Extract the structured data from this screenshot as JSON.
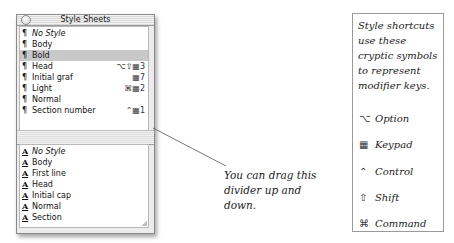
{
  "window": {
    "title": "Style Sheets",
    "paragraph_styles": [
      {
        "label": "No Style",
        "italic": true,
        "shortcut": ""
      },
      {
        "label": "Body",
        "italic": false,
        "shortcut": ""
      },
      {
        "label": "Bold",
        "italic": false,
        "shortcut": "",
        "selected": true
      },
      {
        "label": "Head",
        "italic": false,
        "shortcut": "⌥⇧▦3"
      },
      {
        "label": "Initial graf",
        "italic": false,
        "shortcut": "▦7"
      },
      {
        "label": "Light",
        "italic": false,
        "shortcut": "⌘▦2"
      },
      {
        "label": "Normal",
        "italic": false,
        "shortcut": ""
      },
      {
        "label": "Section number",
        "italic": false,
        "shortcut": "⌃▦1"
      }
    ],
    "character_styles": [
      {
        "label": "No Style",
        "italic": true
      },
      {
        "label": "Body",
        "italic": false
      },
      {
        "label": "First line",
        "italic": false
      },
      {
        "label": "Head",
        "italic": false
      },
      {
        "label": "Initial cap",
        "italic": false
      },
      {
        "label": "Normal",
        "italic": false
      },
      {
        "label": "Section",
        "italic": false
      }
    ],
    "paragraph_glyph": "¶",
    "character_glyph": "A"
  },
  "callout": {
    "text": "You can drag this divider up and down."
  },
  "legend": {
    "intro": "Style shortcuts use these cryptic symbols to represent modifier keys.",
    "items": [
      {
        "icon": "option-icon",
        "symbol": "⌥",
        "label": "Option"
      },
      {
        "icon": "keypad-icon",
        "symbol": "▦",
        "label": "Keypad"
      },
      {
        "icon": "control-icon",
        "symbol": "⌃",
        "label": "Control"
      },
      {
        "icon": "shift-icon",
        "symbol": "⇧",
        "label": "Shift"
      },
      {
        "icon": "command-icon",
        "symbol": "⌘",
        "label": "Command"
      }
    ]
  }
}
